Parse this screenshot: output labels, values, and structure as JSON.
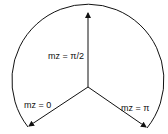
{
  "diagram": {
    "type": "circular-arrow-diagram",
    "center": [
      88,
      87
    ],
    "arrows": [
      {
        "id": "up",
        "label": "mz = π/2",
        "tip": [
          88,
          12
        ]
      },
      {
        "id": "left",
        "label": "mz = 0",
        "tip": [
          28,
          127
        ]
      },
      {
        "id": "right",
        "label": "mz = π",
        "tip": [
          147,
          128
        ]
      }
    ],
    "arc": {
      "from": "left",
      "to": "right",
      "via": "top"
    },
    "stroke_color": "#111111"
  }
}
